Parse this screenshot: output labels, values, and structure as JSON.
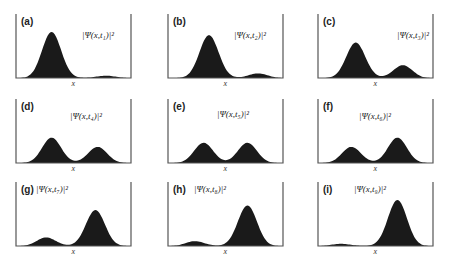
{
  "figure": {
    "x_axis_label": "x",
    "fill_color": "#1a1a1a",
    "frame_color": "#555555",
    "panels": [
      {
        "tag": "(a)",
        "label": "|Ψ(x,t₁)|²",
        "time": "t1"
      },
      {
        "tag": "(b)",
        "label": "|Ψ(x,t₂)|²",
        "time": "t2"
      },
      {
        "tag": "(c)",
        "label": "|Ψ(x,t₃)|²",
        "time": "t3"
      },
      {
        "tag": "(d)",
        "label": "|Ψ(x,t₄)|²",
        "time": "t4"
      },
      {
        "tag": "(e)",
        "label": "|Ψ(x,t₅)|²",
        "time": "t5"
      },
      {
        "tag": "(f)",
        "label": "|Ψ(x,t₆)|²",
        "time": "t6"
      },
      {
        "tag": "(g)",
        "label": "|Ψ(x,t₇)|²",
        "time": "t7"
      },
      {
        "tag": "(h)",
        "label": "|Ψ(x,t₈)|²",
        "time": "t8"
      },
      {
        "tag": "(i)",
        "label": "|Ψ(x,t₉)|²",
        "time": "t9"
      }
    ]
  },
  "chart_data": {
    "type": "area",
    "xlabel": "x",
    "ylabel": "",
    "grid": false,
    "layout": "3x3 small multiples",
    "panels": [
      {
        "tag": "(a)",
        "time": "t1",
        "peaks": [
          {
            "x": 0.3,
            "height": 1.0
          },
          {
            "x": 0.8,
            "height": 0.06
          }
        ]
      },
      {
        "tag": "(b)",
        "time": "t2",
        "peaks": [
          {
            "x": 0.35,
            "height": 0.88
          },
          {
            "x": 0.8,
            "height": 0.12
          }
        ]
      },
      {
        "tag": "(c)",
        "time": "t3",
        "peaks": [
          {
            "x": 0.32,
            "height": 0.75
          },
          {
            "x": 0.75,
            "height": 0.3
          }
        ]
      },
      {
        "tag": "(d)",
        "time": "t4",
        "peaks": [
          {
            "x": 0.3,
            "height": 0.55
          },
          {
            "x": 0.72,
            "height": 0.36
          }
        ]
      },
      {
        "tag": "(e)",
        "time": "t5",
        "peaks": [
          {
            "x": 0.3,
            "height": 0.44
          },
          {
            "x": 0.7,
            "height": 0.44
          }
        ]
      },
      {
        "tag": "(f)",
        "time": "t6",
        "peaks": [
          {
            "x": 0.28,
            "height": 0.36
          },
          {
            "x": 0.7,
            "height": 0.55
          }
        ]
      },
      {
        "tag": "(g)",
        "time": "t7",
        "peaks": [
          {
            "x": 0.25,
            "height": 0.2
          },
          {
            "x": 0.7,
            "height": 0.78
          }
        ]
      },
      {
        "tag": "(h)",
        "time": "t8",
        "peaks": [
          {
            "x": 0.22,
            "height": 0.12
          },
          {
            "x": 0.7,
            "height": 0.88
          }
        ]
      },
      {
        "tag": "(i)",
        "time": "t9",
        "peaks": [
          {
            "x": 0.18,
            "height": 0.06
          },
          {
            "x": 0.7,
            "height": 1.0
          }
        ]
      }
    ]
  }
}
